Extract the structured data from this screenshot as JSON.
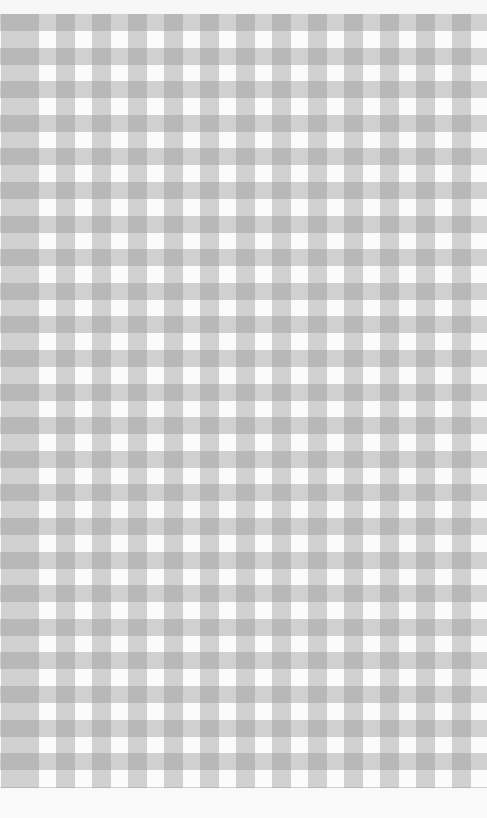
{
  "image": {
    "subject": "gingham checkered fabric",
    "colors": {
      "background": "#fbfbfb",
      "check_light": "#d8d8d8",
      "check_dark": "#a8a8a8"
    },
    "pattern": {
      "horizontal_period_px": 36,
      "vertical_period_px": 33.6
    }
  }
}
